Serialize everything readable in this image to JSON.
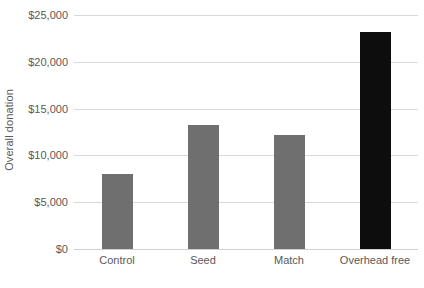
{
  "chart_data": {
    "type": "bar",
    "title": "",
    "xlabel": "",
    "ylabel": "Overall donation",
    "categories": [
      "Control",
      "Seed",
      "Match",
      "Overhead free"
    ],
    "values": [
      8000,
      13250,
      12200,
      23150
    ],
    "ylim": [
      0,
      25000
    ],
    "y_ticks": [
      0,
      5000,
      10000,
      15000,
      20000,
      25000
    ],
    "y_tick_labels": [
      "$0",
      "$5,000",
      "$10,000",
      "$15,000",
      "$20,000",
      "$25,000"
    ],
    "grid": true,
    "legend": "none",
    "bar_colors": [
      "#6f6f6f",
      "#6f6f6f",
      "#6f6f6f",
      "#0d0d0d"
    ],
    "series": [
      {
        "name": "Overall donation",
        "values": [
          8000,
          13250,
          12200,
          23150
        ]
      }
    ]
  },
  "style": {
    "background": "#ffffff",
    "gridline_color": "#d9d9d9",
    "axis_line_color": "#d0d0d0",
    "text_color": "#595959",
    "gray_bar": "#6f6f6f",
    "black_bar": "#0d0d0d"
  }
}
